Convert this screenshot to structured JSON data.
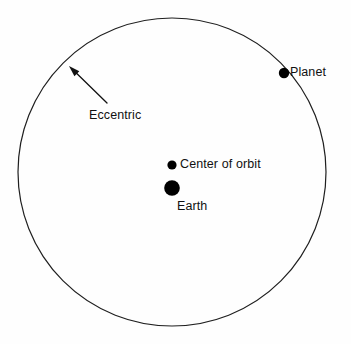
{
  "diagram": {
    "background_color": "#fefefe",
    "stroke_color": "#1f1f1f",
    "fill_color": "#000000"
  },
  "orbit_circle": {
    "name": "eccentric-circle",
    "center_x": 172,
    "center_y": 172,
    "radius": 154,
    "stroke_width": 1.2
  },
  "bodies": [
    {
      "key": "planet",
      "label": "Planet",
      "x": 284,
      "y": 73,
      "radius": 5.2,
      "color": "#000000"
    },
    {
      "key": "center_of_orbit",
      "label": "Center of orbit",
      "x": 172,
      "y": 165,
      "radius": 4.6,
      "color": "#000000"
    },
    {
      "key": "earth",
      "label": "Earth",
      "x": 172,
      "y": 188,
      "radius": 7.8,
      "color": "#000000"
    }
  ],
  "annotation": {
    "key": "eccentric",
    "label": "Eccentric",
    "arrow": {
      "tail_x": 107,
      "tail_y": 103,
      "tip_x": 69,
      "tip_y": 66,
      "stroke_width": 1.3,
      "head_length": 11,
      "head_width": 7
    }
  },
  "labels": {
    "planet": "Planet",
    "center_of_orbit": "Center of orbit",
    "earth": "Earth",
    "eccentric": "Eccentric"
  }
}
